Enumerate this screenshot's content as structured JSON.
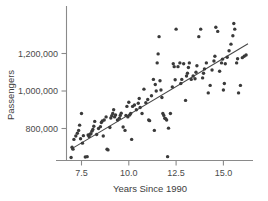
{
  "chart_data": {
    "type": "scatter",
    "title": "",
    "xlabel": "Years Since 1990",
    "ylabel": "Passengers",
    "xlim": [
      6.6,
      16.6
    ],
    "ylim": [
      620000,
      1400000
    ],
    "xticks": [
      7.5,
      10.0,
      12.5,
      15.0
    ],
    "xticklabels": [
      "7.5",
      "10.0",
      "12.5",
      "15.0"
    ],
    "yticks": [
      800000,
      1000000,
      1200000
    ],
    "yticklabels": [
      "800,000",
      "1,000,000",
      "1,200,000"
    ],
    "grid": false,
    "legend": false,
    "marker_color": "#3a3a3a",
    "line_color": "#454545",
    "axis_color": "#8a8a8a",
    "trendline": {
      "type": "linear-fit",
      "x_start": 6.95,
      "y_start": 690000,
      "x_end": 16.3,
      "y_end": 1252000
    },
    "points": [
      [
        6.95,
        645000
      ],
      [
        7.0,
        700000
      ],
      [
        7.05,
        690000
      ],
      [
        7.1,
        742000
      ],
      [
        7.2,
        760000
      ],
      [
        7.28,
        775000
      ],
      [
        7.35,
        790000
      ],
      [
        7.4,
        818000
      ],
      [
        7.45,
        745000
      ],
      [
        7.5,
        880000
      ],
      [
        7.55,
        722000
      ],
      [
        7.6,
        762000
      ],
      [
        7.7,
        648000
      ],
      [
        7.8,
        650000
      ],
      [
        7.85,
        765000
      ],
      [
        7.9,
        757000
      ],
      [
        7.95,
        770000
      ],
      [
        8.0,
        772000
      ],
      [
        8.05,
        786000
      ],
      [
        8.1,
        795000
      ],
      [
        8.15,
        812000
      ],
      [
        8.2,
        838000
      ],
      [
        8.3,
        768000
      ],
      [
        8.4,
        800000
      ],
      [
        8.5,
        810000
      ],
      [
        8.55,
        832000
      ],
      [
        8.6,
        840000
      ],
      [
        8.65,
        760000
      ],
      [
        8.7,
        845000
      ],
      [
        8.8,
        862000
      ],
      [
        8.85,
        690000
      ],
      [
        8.9,
        686000
      ],
      [
        9.0,
        805000
      ],
      [
        9.05,
        856000
      ],
      [
        9.1,
        868000
      ],
      [
        9.15,
        880000
      ],
      [
        9.2,
        900000
      ],
      [
        9.25,
        862000
      ],
      [
        9.3,
        872000
      ],
      [
        9.4,
        845000
      ],
      [
        9.5,
        855000
      ],
      [
        9.55,
        870000
      ],
      [
        9.6,
        882000
      ],
      [
        9.7,
        808000
      ],
      [
        9.8,
        790000
      ],
      [
        9.85,
        870000
      ],
      [
        9.9,
        918000
      ],
      [
        9.95,
        862000
      ],
      [
        10.0,
        940000
      ],
      [
        10.05,
        872000
      ],
      [
        10.1,
        880000
      ],
      [
        10.15,
        742000
      ],
      [
        10.2,
        918000
      ],
      [
        10.3,
        925000
      ],
      [
        10.4,
        900000
      ],
      [
        10.5,
        935000
      ],
      [
        10.55,
        960000
      ],
      [
        10.6,
        912000
      ],
      [
        10.7,
        880000
      ],
      [
        10.8,
        1010000
      ],
      [
        10.9,
        938000
      ],
      [
        11.0,
        955000
      ],
      [
        11.05,
        845000
      ],
      [
        11.1,
        842000
      ],
      [
        11.2,
        975000
      ],
      [
        11.3,
        1062000
      ],
      [
        11.35,
        790000
      ],
      [
        11.4,
        1035000
      ],
      [
        11.45,
        1000000
      ],
      [
        11.5,
        1150000
      ],
      [
        11.55,
        1198000
      ],
      [
        11.6,
        1290000
      ],
      [
        11.65,
        1055000
      ],
      [
        11.7,
        1005000
      ],
      [
        11.75,
        965000
      ],
      [
        11.8,
        880000
      ],
      [
        11.85,
        870000
      ],
      [
        11.9,
        855000
      ],
      [
        11.95,
        852000
      ],
      [
        12.0,
        845000
      ],
      [
        12.05,
        650000
      ],
      [
        12.1,
        802000
      ],
      [
        12.2,
        880000
      ],
      [
        12.3,
        1022000
      ],
      [
        12.35,
        1145000
      ],
      [
        12.4,
        1130000
      ],
      [
        12.45,
        1060000
      ],
      [
        12.5,
        1330000
      ],
      [
        12.6,
        1130000
      ],
      [
        12.7,
        1150000
      ],
      [
        12.75,
        1040000
      ],
      [
        12.8,
        1062000
      ],
      [
        12.9,
        1145000
      ],
      [
        13.0,
        950000
      ],
      [
        13.05,
        1080000
      ],
      [
        13.1,
        1095000
      ],
      [
        13.15,
        1125000
      ],
      [
        13.2,
        1150000
      ],
      [
        13.3,
        1062000
      ],
      [
        13.4,
        1080000
      ],
      [
        13.5,
        1065000
      ],
      [
        13.55,
        1100000
      ],
      [
        13.6,
        1135000
      ],
      [
        13.7,
        1290000
      ],
      [
        13.8,
        1330000
      ],
      [
        13.9,
        1070000
      ],
      [
        13.95,
        1095000
      ],
      [
        14.0,
        1118000
      ],
      [
        14.1,
        1150000
      ],
      [
        14.2,
        990000
      ],
      [
        14.3,
        1030000
      ],
      [
        14.4,
        1112000
      ],
      [
        14.5,
        1160000
      ],
      [
        14.55,
        1185000
      ],
      [
        14.6,
        1340000
      ],
      [
        14.7,
        1318000
      ],
      [
        14.8,
        1105000
      ],
      [
        14.9,
        1150000
      ],
      [
        14.95,
        1170000
      ],
      [
        15.0,
        1005000
      ],
      [
        15.05,
        1040000
      ],
      [
        15.1,
        1145000
      ],
      [
        15.2,
        1180000
      ],
      [
        15.3,
        1215000
      ],
      [
        15.4,
        1250000
      ],
      [
        15.5,
        1295000
      ],
      [
        15.55,
        1360000
      ],
      [
        15.6,
        1330000
      ],
      [
        15.7,
        1150000
      ],
      [
        15.75,
        1172000
      ],
      [
        15.8,
        990000
      ],
      [
        15.9,
        1030000
      ],
      [
        16.0,
        1178000
      ],
      [
        16.1,
        1185000
      ],
      [
        16.2,
        1192000
      ]
    ]
  }
}
